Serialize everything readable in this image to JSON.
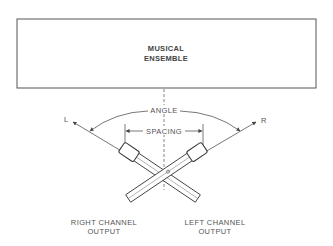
{
  "ensemble": {
    "line1": "MUSICAL",
    "line2": "ENSEMBLE"
  },
  "labels": {
    "angle": "ANGLE",
    "spacing": "SPACING",
    "left_axis": "L",
    "right_axis": "R"
  },
  "outputs": {
    "right_channel_line1": "RIGHT CHANNEL",
    "right_channel_line2": "OUTPUT",
    "left_channel_line1": "LEFT CHANNEL",
    "left_channel_line2": "OUTPUT"
  },
  "colors": {
    "line": "#555555",
    "text": "#555555",
    "background": "#ffffff"
  }
}
